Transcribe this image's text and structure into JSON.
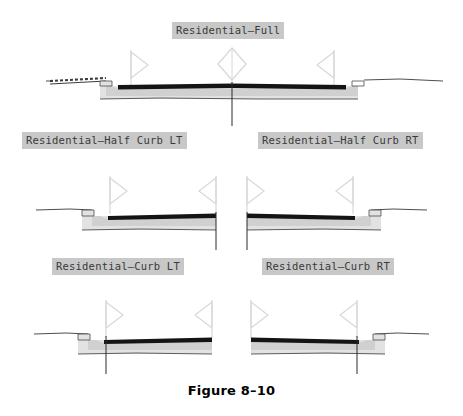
{
  "figure": {
    "caption": "Figure 8–10",
    "background_color": "#ffffff",
    "label_background_color": "#c8c8c8",
    "label_text_color": "#3a3a3a",
    "asphalt_color": "#141414",
    "base_course_color": "#d0d0d0",
    "subbase_color": "#e2e2e2",
    "line_color": "#4d4d4d",
    "marker_color": "#d8d8d8"
  },
  "sections": [
    {
      "id": "residential-full",
      "label": "Residential—Full",
      "type": "full",
      "description": "Full residential roadway cross section with curb and gutter both sides, sidewalk at left, centerline at middle"
    },
    {
      "id": "residential-half-curb-lt",
      "label": "Residential—Half Curb LT",
      "type": "half",
      "side": "LT",
      "description": "Half residential roadway cross section, curb and gutter on left, centerline at right edge"
    },
    {
      "id": "residential-half-curb-rt",
      "label": "Residential—Half Curb RT",
      "type": "half",
      "side": "RT",
      "description": "Half residential roadway cross section, curb and gutter on right, centerline at left edge"
    },
    {
      "id": "residential-curb-lt",
      "label": "Residential—Curb LT",
      "type": "curb",
      "side": "LT",
      "description": "Residential curb cross section, curb and gutter on left, centerline offset left"
    },
    {
      "id": "residential-curb-rt",
      "label": "Residential—Curb RT",
      "type": "curb",
      "side": "RT",
      "description": "Residential curb cross section, curb and gutter on right, centerline offset right"
    }
  ]
}
